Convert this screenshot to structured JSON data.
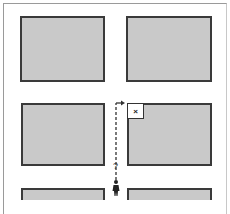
{
  "diagram": {
    "type": "street-grid-navigation",
    "blocks": [
      {
        "id": "top-left",
        "x": 20,
        "y": 16,
        "w": 85,
        "h": 66
      },
      {
        "id": "top-right",
        "x": 126,
        "y": 16,
        "w": 86,
        "h": 66
      },
      {
        "id": "middle-left",
        "x": 21,
        "y": 103,
        "w": 84,
        "h": 63
      },
      {
        "id": "middle-right",
        "x": 127,
        "y": 103,
        "w": 85,
        "h": 63
      },
      {
        "id": "bottom-left",
        "x": 21,
        "y": 188,
        "w": 84,
        "h": 12
      },
      {
        "id": "bottom-right",
        "x": 127,
        "y": 188,
        "w": 85,
        "h": 12
      }
    ],
    "destination_marker": {
      "label": "×"
    },
    "path_label": "?",
    "colors": {
      "block_fill": "#c9c9c9",
      "block_border": "#3a3a3a",
      "path": "#333333",
      "background": "#ffffff"
    }
  }
}
